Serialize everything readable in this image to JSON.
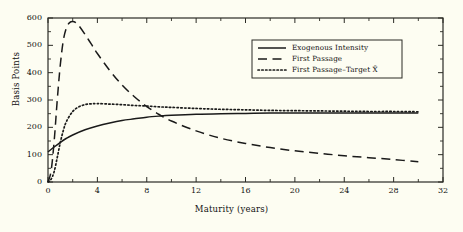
{
  "chart_data": {
    "type": "line",
    "title": "",
    "xlabel": "Maturity (years)",
    "ylabel": "Basis Points",
    "xlim": [
      0,
      32
    ],
    "ylim": [
      0,
      600
    ],
    "xticks": [
      0,
      4,
      8,
      12,
      16,
      20,
      24,
      28,
      32
    ],
    "yticks": [
      0,
      100,
      200,
      300,
      400,
      500,
      600
    ],
    "xtick_minor_step": 2,
    "ytick_minor_step": 50,
    "grid": false,
    "legend_position": "upper-right-inside",
    "series": [
      {
        "name": "Exogenous Intensity",
        "style": "solid",
        "color": "#1a1a1a",
        "x": [
          0,
          0.5,
          1,
          1.5,
          2,
          3,
          4,
          5,
          6,
          7,
          8,
          9,
          10,
          12,
          14,
          16,
          18,
          20,
          22,
          24,
          26,
          28,
          30
        ],
        "y": [
          110,
          128,
          145,
          160,
          172,
          191,
          205,
          216,
          225,
          231,
          237,
          241,
          244,
          248,
          250,
          251,
          252,
          252,
          252,
          252,
          252,
          252,
          252
        ]
      },
      {
        "name": "First Passage",
        "style": "dashed",
        "color": "#1a1a1a",
        "x": [
          0,
          0.25,
          0.5,
          0.75,
          1,
          1.25,
          1.5,
          1.75,
          2,
          2.25,
          2.5,
          3,
          3.5,
          4,
          5,
          6,
          7,
          8,
          9,
          10,
          12,
          14,
          16,
          18,
          20,
          22,
          24,
          26,
          28,
          30
        ],
        "y": [
          0,
          40,
          150,
          300,
          430,
          520,
          565,
          583,
          587,
          583,
          572,
          540,
          505,
          470,
          408,
          355,
          312,
          276,
          247,
          223,
          187,
          160,
          141,
          126,
          114,
          105,
          96,
          89,
          82,
          74
        ]
      },
      {
        "name": "First Passage–Target X̄",
        "style": "dotted",
        "color": "#1a1a1a",
        "x": [
          0,
          0.25,
          0.5,
          0.75,
          1,
          1.25,
          1.5,
          2,
          2.5,
          3,
          3.5,
          4,
          5,
          6,
          7,
          8,
          9,
          10,
          12,
          14,
          16,
          18,
          20,
          22,
          24,
          26,
          28,
          30
        ],
        "y": [
          0,
          10,
          38,
          90,
          145,
          190,
          222,
          258,
          275,
          283,
          286,
          287,
          285,
          283,
          280,
          278,
          275,
          273,
          269,
          266,
          264,
          262,
          261,
          260,
          259,
          258,
          258,
          257
        ]
      }
    ]
  },
  "legend": {
    "items": [
      {
        "label": "Exogenous  Intensity",
        "style": "solid"
      },
      {
        "label": "First  Passage",
        "style": "dashed"
      },
      {
        "label": "First  Passage–Target  X̄",
        "style": "dotted"
      }
    ]
  },
  "axes": {
    "y_title": "Basis Points",
    "x_title": "Maturity (years)",
    "ytick_labels": [
      "0",
      "100",
      "200",
      "300",
      "400",
      "500",
      "600"
    ],
    "xtick_labels": [
      "0",
      "4",
      "8",
      "12",
      "16",
      "20",
      "24",
      "28",
      "32"
    ]
  },
  "colors": {
    "background": "#fdfdf2",
    "ink": "#1a1a1a",
    "frame": "#2b2b25"
  }
}
